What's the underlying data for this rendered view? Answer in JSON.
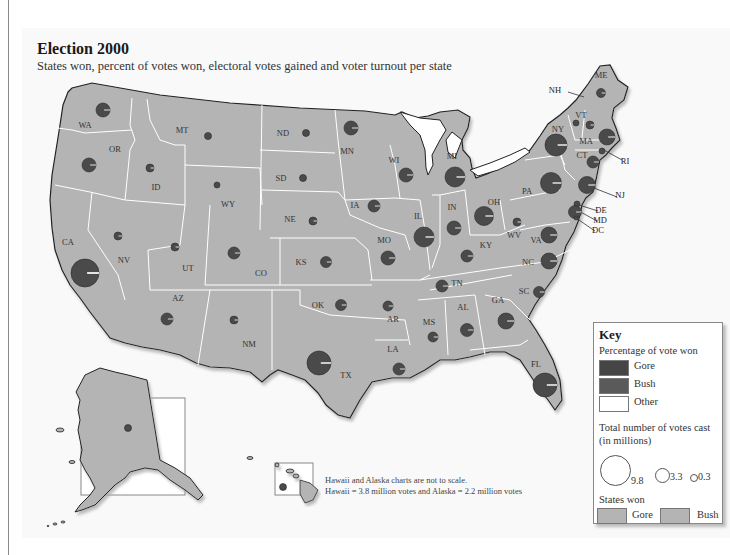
{
  "header": {
    "title": "Election 2000",
    "subtitle": "States won, percent of votes won, electoral votes gained and voter turnout per state"
  },
  "colors": {
    "gore": "#4a4a4a",
    "bush": "#555555",
    "other": "#ffffff",
    "state_fill": "#b4b4b4",
    "state_border": "#ffffff",
    "coast": "#222222",
    "background": "#f9f9f9"
  },
  "note": {
    "line1": "Hawaii and Alaska charts are not to scale.",
    "line2": "Hawaii = 3.8 million votes and Alaska = 2.2  million votes"
  },
  "key": {
    "title": "Key",
    "pct_heading": "Percentage of vote won",
    "pct_items": [
      {
        "label": "Gore"
      },
      {
        "label": "Bush"
      },
      {
        "label": "Other"
      }
    ],
    "votes_heading_1": "Total number of votes cast",
    "votes_heading_2": "(in millions)",
    "votes_sizes": [
      "9.8",
      "3.3",
      "0.3"
    ],
    "won_heading": "States won",
    "won_items": [
      {
        "label": "Gore"
      },
      {
        "label": "Bush"
      }
    ]
  },
  "chart_data": {
    "type": "map",
    "title": "Election 2000",
    "subtitle": "States won, percent of votes won, electoral votes gained and voter turnout per state",
    "legend": {
      "pie_segments": [
        "Gore",
        "Bush",
        "Other"
      ],
      "circle_size_scale_millions": [
        9.8,
        3.3,
        0.3
      ],
      "states_won": [
        "Gore",
        "Bush"
      ]
    },
    "states": [
      {
        "abbr": "WA",
        "x": 103,
        "y": 110,
        "label_x": 85,
        "label_y": 128,
        "r": 7
      },
      {
        "abbr": "OR",
        "x": 89,
        "y": 165,
        "label_x": 115,
        "label_y": 152,
        "r": 7
      },
      {
        "abbr": "CA",
        "x": 85,
        "y": 273,
        "label_x": 68,
        "label_y": 245,
        "r": 14
      },
      {
        "abbr": "NV",
        "x": 118,
        "y": 236,
        "label_x": 124,
        "label_y": 263,
        "r": 4
      },
      {
        "abbr": "ID",
        "x": 150,
        "y": 168,
        "label_x": 156,
        "label_y": 190,
        "r": 4
      },
      {
        "abbr": "MT",
        "x": 208,
        "y": 136,
        "label_x": 182,
        "label_y": 133,
        "r": 3.5
      },
      {
        "abbr": "WY",
        "x": 217,
        "y": 185,
        "label_x": 228,
        "label_y": 207,
        "r": 3
      },
      {
        "abbr": "UT",
        "x": 175,
        "y": 247,
        "label_x": 188,
        "label_y": 271,
        "r": 4
      },
      {
        "abbr": "CO",
        "x": 234,
        "y": 253,
        "label_x": 261,
        "label_y": 276,
        "r": 6
      },
      {
        "abbr": "AZ",
        "x": 167,
        "y": 319,
        "label_x": 178,
        "label_y": 301,
        "r": 6
      },
      {
        "abbr": "NM",
        "x": 234,
        "y": 320,
        "label_x": 249,
        "label_y": 347,
        "r": 4
      },
      {
        "abbr": "ND",
        "x": 306,
        "y": 133,
        "label_x": 283,
        "label_y": 136,
        "r": 3.5
      },
      {
        "abbr": "SD",
        "x": 303,
        "y": 178,
        "label_x": 281,
        "label_y": 181,
        "r": 3.5
      },
      {
        "abbr": "NE",
        "x": 313,
        "y": 221,
        "label_x": 290,
        "label_y": 222,
        "r": 4
      },
      {
        "abbr": "KS",
        "x": 326,
        "y": 262,
        "label_x": 301,
        "label_y": 265,
        "r": 5.5
      },
      {
        "abbr": "OK",
        "x": 341,
        "y": 305,
        "label_x": 318,
        "label_y": 308,
        "r": 5.5
      },
      {
        "abbr": "TX",
        "x": 319,
        "y": 363,
        "label_x": 346,
        "label_y": 378,
        "r": 12
      },
      {
        "abbr": "MN",
        "x": 351,
        "y": 128,
        "label_x": 347,
        "label_y": 154,
        "r": 7
      },
      {
        "abbr": "IA",
        "x": 374,
        "y": 206,
        "label_x": 355,
        "label_y": 208,
        "r": 6
      },
      {
        "abbr": "MO",
        "x": 388,
        "y": 258,
        "label_x": 384,
        "label_y": 243,
        "r": 7
      },
      {
        "abbr": "AR",
        "x": 388,
        "y": 306,
        "label_x": 393,
        "label_y": 322,
        "r": 5
      },
      {
        "abbr": "LA",
        "x": 399,
        "y": 369,
        "label_x": 393,
        "label_y": 352,
        "r": 6
      },
      {
        "abbr": "WI",
        "x": 406,
        "y": 175,
        "label_x": 394,
        "label_y": 163,
        "r": 7
      },
      {
        "abbr": "IL",
        "x": 424,
        "y": 237,
        "label_x": 418,
        "label_y": 219,
        "r": 10
      },
      {
        "abbr": "MI",
        "x": 455,
        "y": 177,
        "label_x": 452,
        "label_y": 159,
        "r": 10
      },
      {
        "abbr": "IN",
        "x": 454,
        "y": 228,
        "label_x": 452,
        "label_y": 210,
        "r": 7
      },
      {
        "abbr": "OH",
        "x": 484,
        "y": 216,
        "label_x": 494,
        "label_y": 205,
        "r": 9.5
      },
      {
        "abbr": "KY",
        "x": 467,
        "y": 256,
        "label_x": 486,
        "label_y": 248,
        "r": 6
      },
      {
        "abbr": "TN",
        "x": 442,
        "y": 286,
        "label_x": 457,
        "label_y": 286,
        "r": 6
      },
      {
        "abbr": "MS",
        "x": 433,
        "y": 337,
        "label_x": 429,
        "label_y": 325,
        "r": 5
      },
      {
        "abbr": "AL",
        "x": 467,
        "y": 330,
        "label_x": 463,
        "label_y": 310,
        "r": 6.5
      },
      {
        "abbr": "GA",
        "x": 506,
        "y": 321,
        "label_x": 498,
        "label_y": 303,
        "r": 8
      },
      {
        "abbr": "FL",
        "x": 545,
        "y": 385,
        "label_x": 536,
        "label_y": 367,
        "r": 12
      },
      {
        "abbr": "SC",
        "x": 539,
        "y": 292,
        "label_x": 524,
        "label_y": 294,
        "r": 5.5
      },
      {
        "abbr": "NC",
        "x": 549,
        "y": 261,
        "label_x": 528,
        "label_y": 265,
        "r": 8
      },
      {
        "abbr": "VA",
        "x": 549,
        "y": 235,
        "label_x": 536,
        "label_y": 243,
        "r": 8
      },
      {
        "abbr": "WV",
        "x": 517,
        "y": 222,
        "label_x": 514,
        "label_y": 238,
        "r": 4
      },
      {
        "abbr": "PA",
        "x": 551,
        "y": 183,
        "label_x": 527,
        "label_y": 194,
        "r": 10.5
      },
      {
        "abbr": "NY",
        "x": 556,
        "y": 145,
        "label_x": 558,
        "label_y": 132,
        "r": 11
      },
      {
        "abbr": "VT",
        "x": 576,
        "y": 123,
        "label_x": 581,
        "label_y": 118,
        "r": 3
      },
      {
        "abbr": "NH",
        "x": 590,
        "y": 125,
        "label_x": 555,
        "label_y": 93,
        "r": 4,
        "callout": true
      },
      {
        "abbr": "ME",
        "x": 601,
        "y": 93,
        "label_x": 601,
        "label_y": 78,
        "r": 4.5
      },
      {
        "abbr": "MA",
        "x": 607,
        "y": 137,
        "label_x": 586,
        "label_y": 144,
        "r": 8
      },
      {
        "abbr": "CT",
        "x": 593,
        "y": 162,
        "label_x": 582,
        "label_y": 158,
        "r": 6
      },
      {
        "abbr": "RI",
        "x": 602,
        "y": 151,
        "label_x": 625,
        "label_y": 164,
        "r": 3,
        "callout": true
      },
      {
        "abbr": "NJ",
        "x": 587,
        "y": 185,
        "label_x": 620,
        "label_y": 198,
        "r": 8.5,
        "callout": true
      },
      {
        "abbr": "DE",
        "x": 577,
        "y": 204,
        "label_x": 601,
        "label_y": 213,
        "r": 3,
        "callout": true
      },
      {
        "abbr": "MD",
        "x": 575,
        "y": 212,
        "label_x": 600,
        "label_y": 223,
        "r": 6.5,
        "callout": true
      },
      {
        "abbr": "DC",
        "x": 576,
        "y": 218,
        "label_x": 598,
        "label_y": 233,
        "r": 2,
        "callout": true
      },
      {
        "abbr": "AK",
        "x": 128,
        "y": 428,
        "r": 3.5
      },
      {
        "abbr": "HI",
        "x": 283,
        "y": 487,
        "r": 3.5
      }
    ],
    "notes": [
      "Hawaii and Alaska charts are not to scale.",
      "Hawaii = 3.8 million votes and Alaska = 2.2  million votes"
    ]
  }
}
